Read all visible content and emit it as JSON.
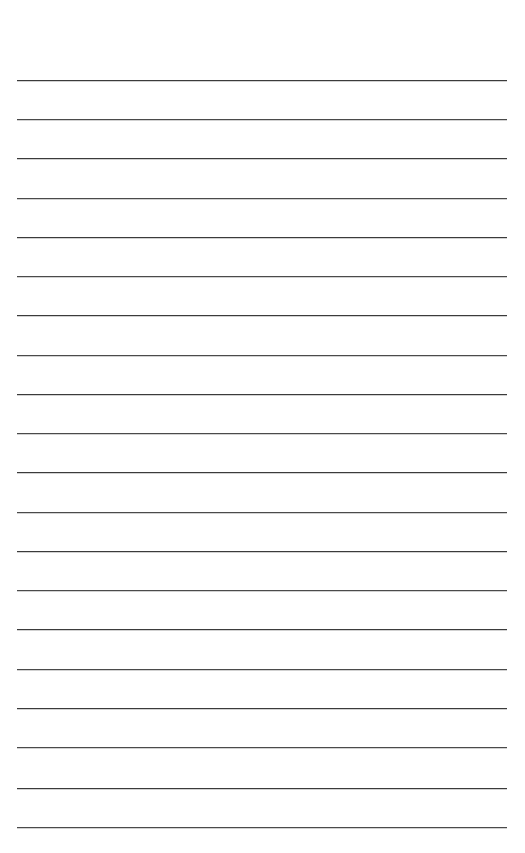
{
  "document": {
    "type": "lined-paper",
    "title": "Blank Lined Notebook Page",
    "page_width": 525,
    "page_height": 853,
    "background_color": "#ffffff",
    "line_color": "#3b3b3b",
    "line_thickness_px": 1,
    "ruling": {
      "style": "wide-ruled",
      "line_count": 20,
      "first_line_y": 80,
      "line_spacing_px": 39.3,
      "left_margin_x": 17,
      "right_margin_x": 507,
      "line_length_px": 490,
      "top_margin_px": 80,
      "bottom_margin_px": 26,
      "has_vertical_margin_rule": false,
      "has_header": false,
      "has_page_number": false,
      "has_holes": false
    },
    "content": {
      "text": "",
      "is_blank": true,
      "placeholder": ""
    },
    "lines": [
      {
        "index": 1,
        "y": 80,
        "text": ""
      },
      {
        "index": 2,
        "y": 119,
        "text": ""
      },
      {
        "index": 3,
        "y": 158,
        "text": ""
      },
      {
        "index": 4,
        "y": 198,
        "text": ""
      },
      {
        "index": 5,
        "y": 237,
        "text": ""
      },
      {
        "index": 6,
        "y": 276,
        "text": ""
      },
      {
        "index": 7,
        "y": 315,
        "text": ""
      },
      {
        "index": 8,
        "y": 355,
        "text": ""
      },
      {
        "index": 9,
        "y": 394,
        "text": ""
      },
      {
        "index": 10,
        "y": 433,
        "text": ""
      },
      {
        "index": 11,
        "y": 472,
        "text": ""
      },
      {
        "index": 12,
        "y": 512,
        "text": ""
      },
      {
        "index": 13,
        "y": 551,
        "text": ""
      },
      {
        "index": 14,
        "y": 590,
        "text": ""
      },
      {
        "index": 15,
        "y": 629,
        "text": ""
      },
      {
        "index": 16,
        "y": 669,
        "text": ""
      },
      {
        "index": 17,
        "y": 708,
        "text": ""
      },
      {
        "index": 18,
        "y": 747,
        "text": ""
      },
      {
        "index": 19,
        "y": 788,
        "text": ""
      },
      {
        "index": 20,
        "y": 827,
        "text": ""
      }
    ]
  }
}
